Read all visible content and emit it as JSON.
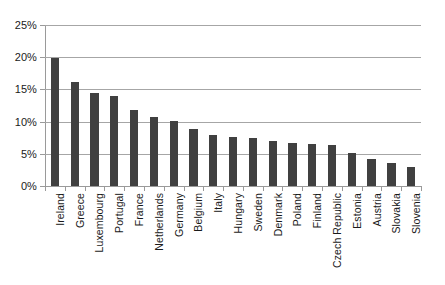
{
  "chart_data": {
    "type": "bar",
    "title": "",
    "subtitle": "",
    "xlabel": "",
    "ylabel": "",
    "ylim": [
      0,
      25
    ],
    "ytick_labels": [
      "25%",
      "20%",
      "15%",
      "10%",
      "5%",
      "0%"
    ],
    "ytick_values": [
      25,
      20,
      15,
      10,
      5,
      0
    ],
    "grid": true,
    "legend": false,
    "legend_position": "none",
    "bar_color": "#404040",
    "gridline_color": "#a6a6a6",
    "axis_color": "#9a9a9a",
    "background_color": "#ffffff",
    "categories": [
      "Ireland",
      "Greece",
      "Luxembourg",
      "Portugal",
      "France",
      "Netherlands",
      "Germany",
      "Belgium",
      "Italy",
      "Hungary",
      "Sweden",
      "Denmark",
      "Poland",
      "Finland",
      "Czech Republic",
      "Estonia",
      "Austria",
      "Slovakia",
      "Slovenia"
    ],
    "values": [
      19.9,
      16.1,
      14.4,
      13.9,
      11.8,
      10.7,
      10.1,
      8.8,
      7.9,
      7.6,
      7.5,
      7.0,
      6.7,
      6.5,
      6.4,
      5.2,
      4.2,
      3.6,
      3.0
    ],
    "value_unit": "%",
    "sorted": "descending"
  }
}
